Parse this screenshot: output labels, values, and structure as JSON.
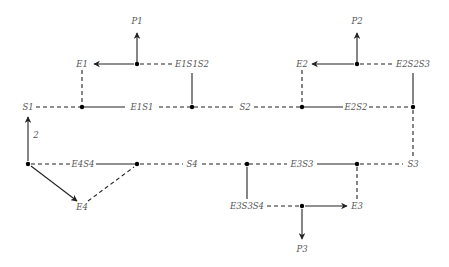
{
  "diagram": {
    "type": "state-transition network",
    "nodes": {
      "S1": "S1",
      "S2": "S2",
      "S3": "S3",
      "S4": "S4",
      "E1": "E1",
      "E2": "E2",
      "E3": "E3",
      "E4": "E4",
      "E1S1": "E1S1",
      "E2S2": "E2S2",
      "E3S3": "E3S3",
      "E4S4": "E4S4",
      "E1S1S2": "E1S1S2",
      "E2S2S3": "E2S2S3",
      "E3S3S4": "E3S3S4",
      "P1": "P1",
      "P2": "P2",
      "P3": "P3"
    },
    "edge_labels": {
      "s4_to_s1": "2"
    },
    "colors": {
      "line": "#222222",
      "dot": "#000000",
      "label": "#555555",
      "background": "#ffffff"
    }
  }
}
